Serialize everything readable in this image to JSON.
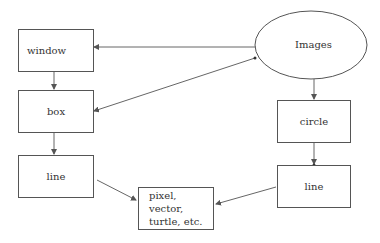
{
  "diagram": {
    "nodes": {
      "images": {
        "label": "Images",
        "shape": "ellipse"
      },
      "window": {
        "label": "window",
        "shape": "rect"
      },
      "box": {
        "label": "box",
        "shape": "rect"
      },
      "line_left": {
        "label": "line",
        "shape": "rect"
      },
      "circle": {
        "label": "circle",
        "shape": "rect"
      },
      "line_right": {
        "label": "line",
        "shape": "rect"
      },
      "pixel": {
        "label_line1": "pixel, vector,",
        "label_line2": "turtle, etc.",
        "shape": "rect"
      }
    },
    "edges": [
      {
        "from": "Images",
        "to": "window"
      },
      {
        "from": "Images",
        "to": "box"
      },
      {
        "from": "window",
        "to": "box"
      },
      {
        "from": "box",
        "to": "line"
      },
      {
        "from": "line",
        "to": "pixel, vector, turtle, etc."
      },
      {
        "from": "Images",
        "to": "circle"
      },
      {
        "from": "circle",
        "to": "line"
      },
      {
        "from": "line",
        "to": "pixel, vector, turtle, etc."
      }
    ]
  }
}
